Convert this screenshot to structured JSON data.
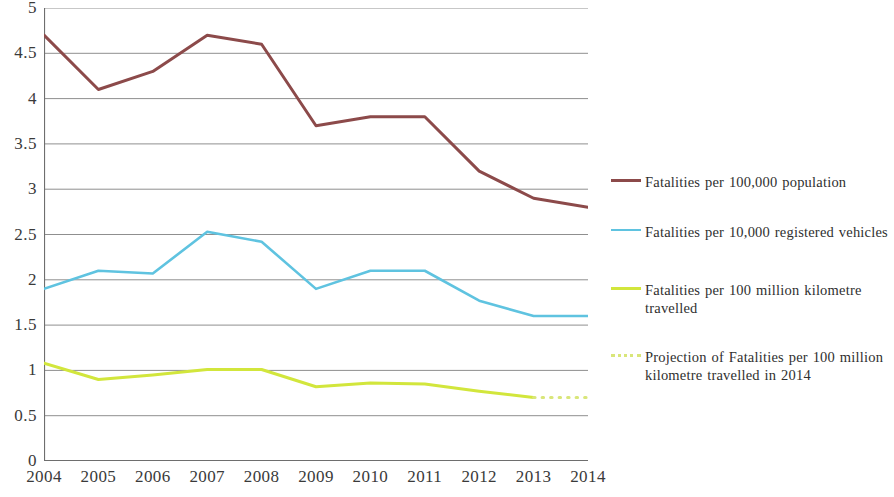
{
  "chart_data": {
    "type": "line",
    "title": "",
    "subtitle": "",
    "xlabel": "",
    "ylabel": "",
    "categories": [
      "2004",
      "2005",
      "2006",
      "2007",
      "2008",
      "2009",
      "2010",
      "2011",
      "2012",
      "2013",
      "2014"
    ],
    "x": [
      2004,
      2005,
      2006,
      2007,
      2008,
      2009,
      2010,
      2011,
      2012,
      2013,
      2014
    ],
    "ylim": [
      0,
      5
    ],
    "xlim": [
      2004,
      2014
    ],
    "ytick_labels": [
      "0",
      "0.5",
      "1",
      "1.5",
      "2",
      "2.5",
      "3",
      "3.5",
      "4",
      "4.5",
      "5"
    ],
    "ytick_values": [
      0,
      0.5,
      1,
      1.5,
      2,
      2.5,
      3,
      3.5,
      4,
      4.5,
      5
    ],
    "grid": "horizontal",
    "legend_position": "right",
    "series": [
      {
        "name": "Fatalities per 100,000 population",
        "color": "#8c4a4a",
        "style": "solid",
        "width": 3,
        "values": [
          4.7,
          4.1,
          4.3,
          4.7,
          4.6,
          3.7,
          3.8,
          3.8,
          3.2,
          2.9,
          2.8
        ]
      },
      {
        "name": "Fatalities per 10,000 registered vehicles",
        "color": "#5fc3e0",
        "style": "solid",
        "width": 2.6,
        "values": [
          1.9,
          2.1,
          2.07,
          2.53,
          2.42,
          1.9,
          2.1,
          2.1,
          1.77,
          1.6,
          1.6
        ]
      },
      {
        "name": "Fatalities per 100 million kilometre travelled",
        "color": "#d2e63c",
        "style": "solid",
        "width": 3,
        "values": [
          1.08,
          0.9,
          0.95,
          1.01,
          1.01,
          0.82,
          0.86,
          0.85,
          0.77,
          0.7,
          null
        ]
      },
      {
        "name": "Projection of Fatalities per 100 million kilometre travelled in 2014",
        "color": "#d9e67a",
        "style": "dotted",
        "width": 3,
        "values": [
          null,
          null,
          null,
          null,
          null,
          null,
          null,
          null,
          null,
          0.7,
          0.7
        ]
      }
    ]
  },
  "legend": {
    "items": [
      {
        "label": "Fatalities per 100,000 population",
        "color": "#8c4a4a",
        "style": "solid"
      },
      {
        "label": "Fatalities per 10,000 registered vehicles",
        "color": "#5fc3e0",
        "style": "solid"
      },
      {
        "label": "Fatalities per 100 million kilometre travelled",
        "color": "#d2e63c",
        "style": "solid"
      },
      {
        "label": "Projection of Fatalities per 100 million kilometre travelled in 2014",
        "color": "#d9e67a",
        "style": "dotted"
      }
    ]
  },
  "axes": {
    "y_ticks": [
      "5",
      "4.5",
      "4",
      "3.5",
      "3",
      "2.5",
      "2",
      "1.5",
      "1",
      "0.5",
      "0"
    ],
    "x_ticks": [
      "2004",
      "2005",
      "2006",
      "2007",
      "2008",
      "2009",
      "2010",
      "2011",
      "2012",
      "2013",
      "2014"
    ]
  },
  "colors": {
    "axis": "#6e6e6e",
    "grid": "#8f8f8f",
    "text": "#3a3a3a",
    "background": "#ffffff"
  }
}
